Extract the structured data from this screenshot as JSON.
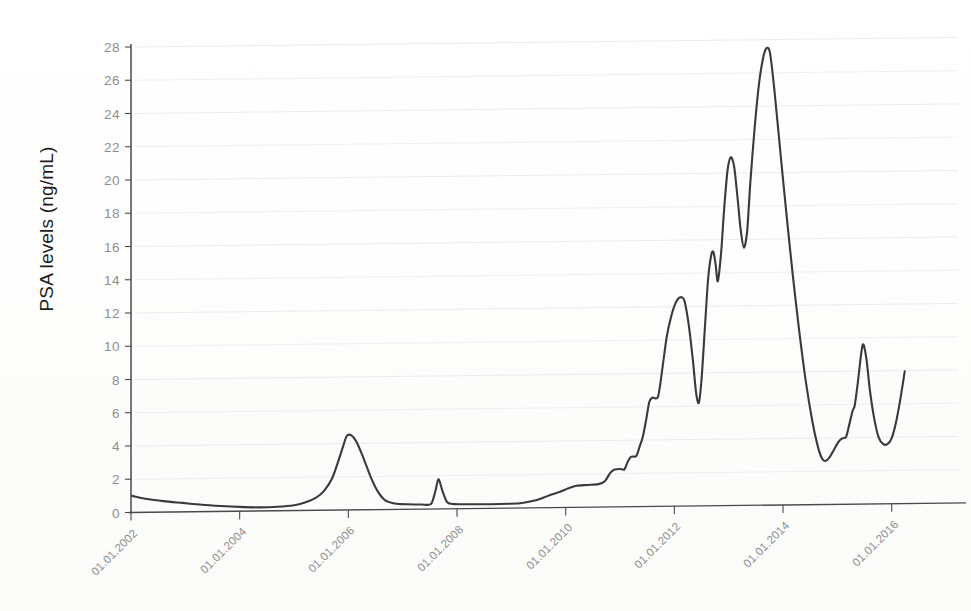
{
  "chart_data": {
    "type": "line",
    "title": "",
    "subtitle": "",
    "xlabel": "",
    "ylabel": "PSA levels (ng/mL)",
    "grid": "horizontal-major",
    "legend": "none",
    "line_color": "#3a3a3a",
    "axis_color": "#4a4a4a",
    "gridline_color": "#e9e9ec",
    "tick_label_color": "#8e8e8e",
    "ylim": [
      0,
      28
    ],
    "y_ticks": [
      0,
      2,
      4,
      6,
      8,
      10,
      12,
      14,
      16,
      18,
      20,
      22,
      24,
      26,
      28
    ],
    "x_ticks": [
      "01.01.2002",
      "01.01.2004",
      "01.01.2006",
      "01.01.2008",
      "01.01.2010",
      "01.01.2012",
      "01.01.2014",
      "01.01.2016"
    ],
    "x_tick_years": [
      2002,
      2004,
      2006,
      2008,
      2010,
      2012,
      2014,
      2016
    ],
    "xlim": [
      2002.0,
      2016.3
    ],
    "series": [
      {
        "name": "PSA",
        "points": [
          [
            2002.02,
            1.0
          ],
          [
            2002.3,
            0.8
          ],
          [
            2002.6,
            0.66
          ],
          [
            2002.95,
            0.54
          ],
          [
            2003.3,
            0.42
          ],
          [
            2003.65,
            0.33
          ],
          [
            2004.0,
            0.26
          ],
          [
            2004.35,
            0.22
          ],
          [
            2004.7,
            0.24
          ],
          [
            2005.0,
            0.32
          ],
          [
            2005.2,
            0.48
          ],
          [
            2005.4,
            0.75
          ],
          [
            2005.55,
            1.15
          ],
          [
            2005.7,
            1.9
          ],
          [
            2005.8,
            2.8
          ],
          [
            2005.9,
            3.8
          ],
          [
            2005.97,
            4.45
          ],
          [
            2006.05,
            4.5
          ],
          [
            2006.15,
            4.1
          ],
          [
            2006.28,
            3.1
          ],
          [
            2006.42,
            1.9
          ],
          [
            2006.55,
            1.05
          ],
          [
            2006.68,
            0.55
          ],
          [
            2006.85,
            0.36
          ],
          [
            2007.1,
            0.3
          ],
          [
            2007.35,
            0.28
          ],
          [
            2007.52,
            0.3
          ],
          [
            2007.6,
            1.05
          ],
          [
            2007.66,
            1.8
          ],
          [
            2007.73,
            1.1
          ],
          [
            2007.82,
            0.4
          ],
          [
            2007.95,
            0.28
          ],
          [
            2008.25,
            0.26
          ],
          [
            2008.6,
            0.25
          ],
          [
            2008.95,
            0.26
          ],
          [
            2009.2,
            0.3
          ],
          [
            2009.45,
            0.45
          ],
          [
            2009.6,
            0.62
          ],
          [
            2009.75,
            0.8
          ],
          [
            2009.9,
            0.95
          ],
          [
            2010.05,
            1.15
          ],
          [
            2010.2,
            1.3
          ],
          [
            2010.4,
            1.34
          ],
          [
            2010.6,
            1.38
          ],
          [
            2010.72,
            1.55
          ],
          [
            2010.82,
            2.05
          ],
          [
            2010.9,
            2.25
          ],
          [
            2011.0,
            2.28
          ],
          [
            2011.08,
            2.25
          ],
          [
            2011.14,
            2.7
          ],
          [
            2011.2,
            3.0
          ],
          [
            2011.3,
            3.05
          ],
          [
            2011.36,
            3.6
          ],
          [
            2011.42,
            4.2
          ],
          [
            2011.48,
            5.2
          ],
          [
            2011.54,
            6.3
          ],
          [
            2011.6,
            6.55
          ],
          [
            2011.7,
            6.6
          ],
          [
            2011.78,
            8.3
          ],
          [
            2011.86,
            10.2
          ],
          [
            2011.94,
            11.4
          ],
          [
            2012.02,
            12.2
          ],
          [
            2012.1,
            12.55
          ],
          [
            2012.18,
            12.4
          ],
          [
            2012.26,
            11.0
          ],
          [
            2012.34,
            8.8
          ],
          [
            2012.4,
            6.8
          ],
          [
            2012.45,
            6.2
          ],
          [
            2012.5,
            7.6
          ],
          [
            2012.56,
            10.6
          ],
          [
            2012.62,
            13.6
          ],
          [
            2012.68,
            15.1
          ],
          [
            2012.72,
            15.25
          ],
          [
            2012.76,
            14.5
          ],
          [
            2012.8,
            13.5
          ],
          [
            2012.86,
            15.2
          ],
          [
            2012.92,
            18.0
          ],
          [
            2012.98,
            20.2
          ],
          [
            2013.04,
            20.95
          ],
          [
            2013.1,
            20.4
          ],
          [
            2013.16,
            18.6
          ],
          [
            2013.22,
            16.6
          ],
          [
            2013.28,
            15.5
          ],
          [
            2013.34,
            16.5
          ],
          [
            2013.4,
            19.5
          ],
          [
            2013.48,
            22.8
          ],
          [
            2013.56,
            25.4
          ],
          [
            2013.64,
            27.0
          ],
          [
            2013.7,
            27.5
          ],
          [
            2013.76,
            27.2
          ],
          [
            2013.84,
            25.0
          ],
          [
            2013.94,
            21.6
          ],
          [
            2014.06,
            17.6
          ],
          [
            2014.18,
            13.8
          ],
          [
            2014.3,
            10.4
          ],
          [
            2014.42,
            7.4
          ],
          [
            2014.54,
            5.0
          ],
          [
            2014.64,
            3.5
          ],
          [
            2014.72,
            2.75
          ],
          [
            2014.78,
            2.62
          ],
          [
            2014.86,
            2.85
          ],
          [
            2014.94,
            3.3
          ],
          [
            2015.02,
            3.75
          ],
          [
            2015.08,
            3.95
          ],
          [
            2015.16,
            4.05
          ],
          [
            2015.22,
            4.8
          ],
          [
            2015.28,
            5.6
          ],
          [
            2015.32,
            5.95
          ],
          [
            2015.38,
            7.4
          ],
          [
            2015.44,
            9.1
          ],
          [
            2015.48,
            9.6
          ],
          [
            2015.54,
            8.6
          ],
          [
            2015.6,
            6.8
          ],
          [
            2015.68,
            5.1
          ],
          [
            2015.76,
            4.0
          ],
          [
            2015.84,
            3.6
          ],
          [
            2015.92,
            3.58
          ],
          [
            2016.0,
            3.95
          ],
          [
            2016.08,
            4.9
          ],
          [
            2016.16,
            6.3
          ],
          [
            2016.24,
            7.95
          ]
        ]
      }
    ]
  }
}
